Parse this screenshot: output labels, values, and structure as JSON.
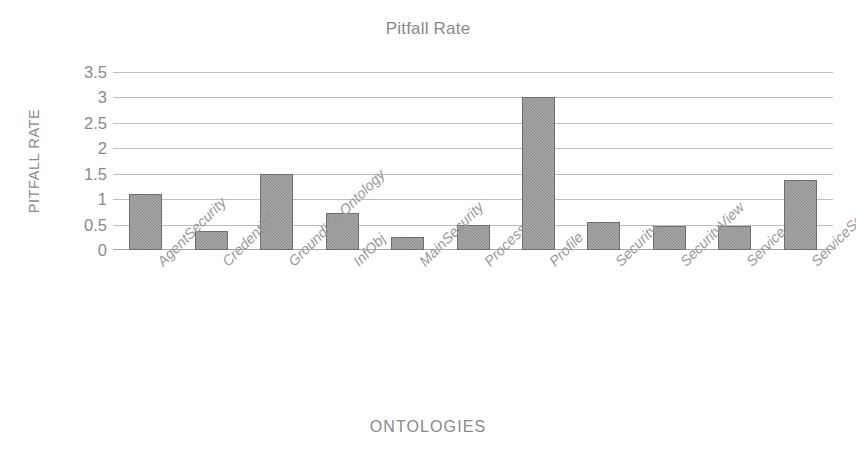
{
  "chart_data": {
    "type": "bar",
    "title": "Pitfall Rate",
    "xlabel": "ONTOLOGIES",
    "ylabel": "PITFALL RATE",
    "categories": [
      "AgentSecurity",
      "Credential",
      "Grounding Ontology",
      "InfObj",
      "MainSecurity",
      "Process",
      "Profile",
      "Security",
      "SecurityView",
      "Service",
      "ServiceSecurity"
    ],
    "values": [
      1.1,
      0.38,
      1.5,
      0.72,
      0.25,
      0.5,
      3.0,
      0.55,
      0.47,
      0.48,
      1.37
    ],
    "ylim": [
      0,
      3.5
    ],
    "ytick_labels": [
      "3.5",
      "3",
      "2.5",
      "2",
      "1.5",
      "1",
      "0.5",
      "0"
    ],
    "ytick_values": [
      3.5,
      3,
      2.5,
      2,
      1.5,
      1,
      0.5,
      0
    ],
    "grid": true,
    "legend": false,
    "series": [
      {
        "name": "Pitfall Rate",
        "values": [
          1.1,
          0.38,
          1.5,
          0.72,
          0.25,
          0.5,
          3.0,
          0.55,
          0.47,
          0.48,
          1.37
        ]
      }
    ],
    "colors": {
      "bar_fill": "#8d8d8d",
      "bar_border": "#6e6e6e",
      "gridline": "#bfbfbf",
      "axis": "#a6a6a6",
      "text": "#8a8a8a",
      "background": "#ffffff"
    }
  }
}
